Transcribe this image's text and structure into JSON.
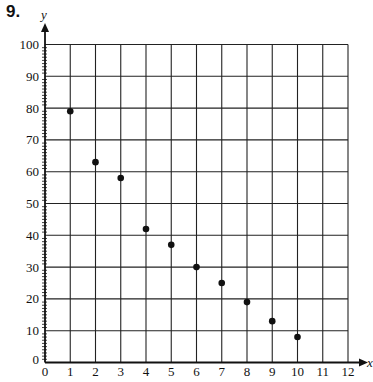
{
  "problem": {
    "number": "9."
  },
  "chart_data": {
    "type": "scatter",
    "title": "",
    "xlabel": "x",
    "ylabel": "y",
    "xlim": [
      0,
      12
    ],
    "ylim": [
      0,
      100
    ],
    "x_ticks": [
      0,
      1,
      2,
      3,
      4,
      5,
      6,
      7,
      8,
      9,
      10,
      11,
      12
    ],
    "y_ticks": [
      0,
      10,
      20,
      30,
      40,
      50,
      60,
      70,
      80,
      90,
      100
    ],
    "y_minor_tick_step": 1,
    "grid": true,
    "legend": null,
    "series": [
      {
        "name": "data",
        "x": [
          1,
          2,
          3,
          4,
          5,
          6,
          7,
          8,
          9,
          10
        ],
        "y": [
          79,
          63,
          58,
          42,
          37,
          30,
          25,
          19,
          13,
          8
        ]
      }
    ],
    "colors": {
      "ink": "#111111",
      "grid": "#222222",
      "background": "#ffffff"
    }
  }
}
